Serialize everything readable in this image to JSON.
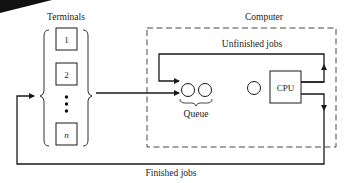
{
  "diagram": {
    "terminals_label": "Terminals",
    "terminals": [
      "1",
      "2",
      "n"
    ],
    "computer_label": "Computer",
    "unfinished_label": "Unfinished jobs",
    "queue_label": "Queue",
    "cpu_label": "CPU",
    "finished_label": "Finished jobs"
  },
  "colors": {
    "line": "#1a1a1a",
    "dashed": "#333333",
    "background": "#ffffff"
  }
}
